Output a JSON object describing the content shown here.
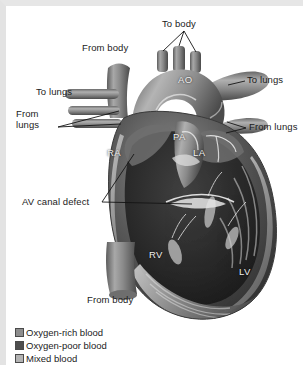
{
  "figure": {
    "style": "grayscale medical illustration"
  },
  "labels": {
    "to_body": "To body",
    "from_body_top": "From body",
    "to_lungs_right": "To lungs",
    "to_lungs_left": "To lungs",
    "from_lungs_left_line1": "From",
    "from_lungs_left_line2": "lungs",
    "from_lungs_right": "From lungs",
    "av_canal_defect": "AV canal defect",
    "from_body_bottom": "From body"
  },
  "chambers": {
    "ao": "AO",
    "pa": "PA",
    "ra": "RA",
    "la": "LA",
    "rv": "RV",
    "lv": "LV"
  },
  "legend": {
    "items": [
      {
        "label": "Oxygen-rich blood",
        "color": "#8d8d8d"
      },
      {
        "label": "Oxygen-poor blood",
        "color": "#4e4e4e"
      },
      {
        "label": "Mixed blood",
        "color": "#b3b3b3"
      }
    ]
  },
  "colors": {
    "background": "#ffffff",
    "frame": "#e3e3e3",
    "label_text": "#1b1b1b",
    "chamber_text": "#f0f0f0",
    "leader_line": "#141414",
    "heart_dark": "#2c2c2c",
    "heart_mid": "#6f6f6f",
    "heart_light": "#c9c9c9"
  }
}
